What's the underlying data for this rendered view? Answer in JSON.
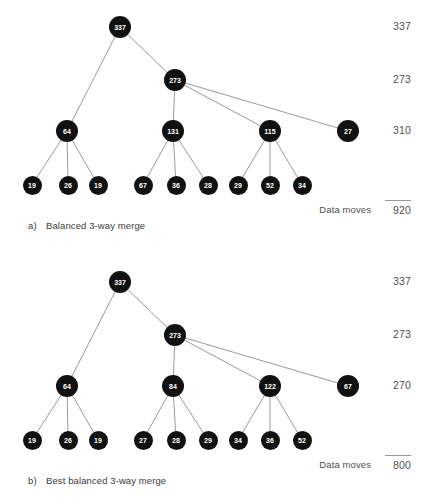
{
  "figure": {
    "type": "tree-diagram",
    "node_fill": "#111111",
    "node_text": "#ffffff",
    "edge_color": "#808080",
    "rail_text_color": "#4f4f4f"
  },
  "panels": [
    {
      "id": "a",
      "caption_tag": "a)",
      "caption_text": "Balanced 3-way merge",
      "root": {
        "label": "337",
        "x": 120,
        "y": 27
      },
      "level2": [
        {
          "label": "273",
          "x": 175,
          "y": 80
        }
      ],
      "level3": [
        {
          "label": "64",
          "x": 67,
          "y": 131
        },
        {
          "label": "131",
          "x": 173,
          "y": 131
        },
        {
          "label": "115",
          "x": 270,
          "y": 131
        },
        {
          "label": "27",
          "x": 348,
          "y": 131
        }
      ],
      "leaves": [
        {
          "label": "19",
          "x": 32,
          "y": 185
        },
        {
          "label": "26",
          "x": 68,
          "y": 185
        },
        {
          "label": "19",
          "x": 98,
          "y": 185
        },
        {
          "label": "67",
          "x": 143,
          "y": 185
        },
        {
          "label": "36",
          "x": 176,
          "y": 185
        },
        {
          "label": "28",
          "x": 208,
          "y": 185
        },
        {
          "label": "29",
          "x": 238,
          "y": 185
        },
        {
          "label": "52",
          "x": 270,
          "y": 185
        },
        {
          "label": "34",
          "x": 302,
          "y": 185
        }
      ],
      "edges": [
        [
          120,
          27,
          67,
          131
        ],
        [
          120,
          27,
          175,
          80
        ],
        [
          175,
          80,
          173,
          131
        ],
        [
          175,
          80,
          270,
          131
        ],
        [
          175,
          80,
          348,
          131
        ],
        [
          67,
          131,
          32,
          185
        ],
        [
          67,
          131,
          68,
          185
        ],
        [
          67,
          131,
          98,
          185
        ],
        [
          173,
          131,
          143,
          185
        ],
        [
          173,
          131,
          176,
          185
        ],
        [
          173,
          131,
          208,
          185
        ],
        [
          270,
          131,
          238,
          185
        ],
        [
          270,
          131,
          270,
          185
        ],
        [
          270,
          131,
          302,
          185
        ]
      ],
      "rail": [
        {
          "value": "337",
          "y": 27
        },
        {
          "value": "273",
          "y": 80
        },
        {
          "value": "310",
          "y": 131
        }
      ],
      "total_label": "Data moves",
      "total_value": "920",
      "total_y": 210
    },
    {
      "id": "b",
      "caption_tag": "b)",
      "caption_text": "Best balanced 3-way merge",
      "root": {
        "label": "337",
        "x": 120,
        "y": 27
      },
      "level2": [
        {
          "label": "273",
          "x": 175,
          "y": 80
        }
      ],
      "level3": [
        {
          "label": "64",
          "x": 67,
          "y": 131
        },
        {
          "label": "84",
          "x": 173,
          "y": 131
        },
        {
          "label": "122",
          "x": 270,
          "y": 131
        },
        {
          "label": "67",
          "x": 348,
          "y": 131
        }
      ],
      "leaves": [
        {
          "label": "19",
          "x": 32,
          "y": 185
        },
        {
          "label": "26",
          "x": 68,
          "y": 185
        },
        {
          "label": "19",
          "x": 98,
          "y": 185
        },
        {
          "label": "27",
          "x": 143,
          "y": 185
        },
        {
          "label": "28",
          "x": 176,
          "y": 185
        },
        {
          "label": "29",
          "x": 208,
          "y": 185
        },
        {
          "label": "34",
          "x": 238,
          "y": 185
        },
        {
          "label": "36",
          "x": 270,
          "y": 185
        },
        {
          "label": "52",
          "x": 302,
          "y": 185
        }
      ],
      "edges": [
        [
          120,
          27,
          67,
          131
        ],
        [
          120,
          27,
          175,
          80
        ],
        [
          175,
          80,
          173,
          131
        ],
        [
          175,
          80,
          270,
          131
        ],
        [
          175,
          80,
          348,
          131
        ],
        [
          67,
          131,
          32,
          185
        ],
        [
          67,
          131,
          68,
          185
        ],
        [
          67,
          131,
          98,
          185
        ],
        [
          173,
          131,
          143,
          185
        ],
        [
          173,
          131,
          176,
          185
        ],
        [
          173,
          131,
          208,
          185
        ],
        [
          270,
          131,
          238,
          185
        ],
        [
          270,
          131,
          270,
          185
        ],
        [
          270,
          131,
          302,
          185
        ]
      ],
      "rail": [
        {
          "value": "337",
          "y": 27
        },
        {
          "value": "273",
          "y": 80
        },
        {
          "value": "270",
          "y": 131
        }
      ],
      "total_label": "Data moves",
      "total_value": "800",
      "total_y": 210
    }
  ],
  "chart_data": {
    "type": "diagram",
    "trees": [
      {
        "name": "Balanced 3-way merge",
        "root": 337,
        "levels": [
          [
            337
          ],
          [
            64,
            273
          ],
          [
            131,
            115,
            27
          ],
          [
            19,
            26,
            19,
            67,
            36,
            28,
            29,
            52,
            34
          ]
        ],
        "level_sums": [
          337,
          273,
          310
        ],
        "data_moves": 920
      },
      {
        "name": "Best balanced 3-way merge",
        "root": 337,
        "levels": [
          [
            337
          ],
          [
            64,
            273
          ],
          [
            84,
            122,
            67
          ],
          [
            19,
            26,
            19,
            27,
            28,
            29,
            34,
            36,
            52
          ]
        ],
        "level_sums": [
          337,
          273,
          270
        ],
        "data_moves": 800
      }
    ]
  }
}
